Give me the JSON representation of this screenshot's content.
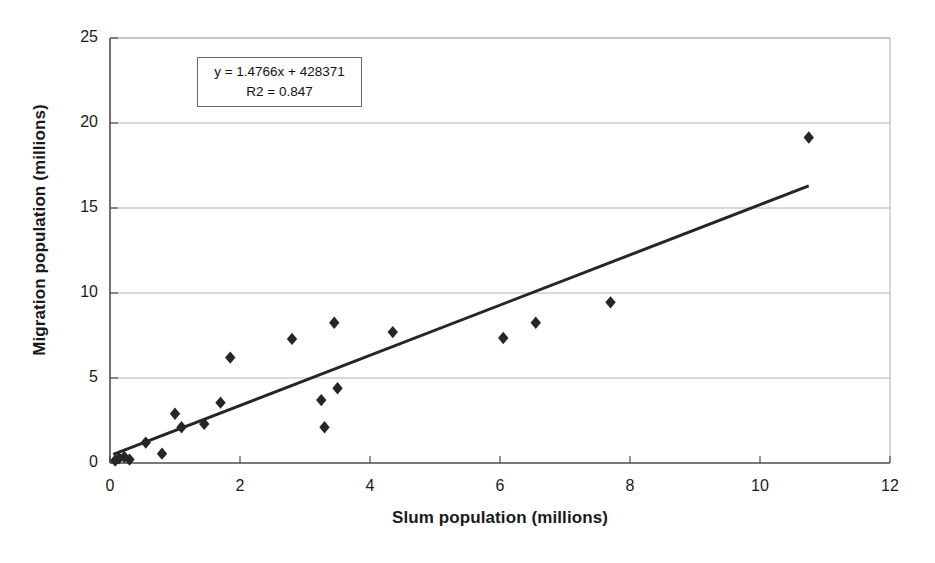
{
  "chart_data": {
    "type": "scatter",
    "title": "",
    "xlabel": "Slum population (millions)",
    "ylabel": "Migration population (millions)",
    "xlim": [
      0,
      12
    ],
    "ylim": [
      0,
      25
    ],
    "xticks": [
      "0",
      "2",
      "4",
      "6",
      "8",
      "10",
      "12"
    ],
    "xtick_values": [
      0,
      2,
      4,
      6,
      8,
      10,
      12
    ],
    "yticks": [
      "0",
      "5",
      "10",
      "15",
      "20",
      "25"
    ],
    "ytick_values": [
      0,
      5,
      10,
      15,
      20,
      25
    ],
    "grid": "horizontal",
    "legend": "none",
    "marker": "diamond",
    "marker_color": "#262626",
    "points": [
      {
        "x": 0.08,
        "y": 0.15
      },
      {
        "x": 0.14,
        "y": 0.28
      },
      {
        "x": 0.22,
        "y": 0.35
      },
      {
        "x": 0.3,
        "y": 0.2
      },
      {
        "x": 0.55,
        "y": 1.2
      },
      {
        "x": 0.8,
        "y": 0.55
      },
      {
        "x": 1.0,
        "y": 2.9
      },
      {
        "x": 1.1,
        "y": 2.1
      },
      {
        "x": 1.45,
        "y": 2.3
      },
      {
        "x": 1.7,
        "y": 3.55
      },
      {
        "x": 1.85,
        "y": 6.2
      },
      {
        "x": 2.8,
        "y": 7.3
      },
      {
        "x": 3.25,
        "y": 3.7
      },
      {
        "x": 3.3,
        "y": 2.1
      },
      {
        "x": 3.45,
        "y": 8.25
      },
      {
        "x": 3.5,
        "y": 4.4
      },
      {
        "x": 4.35,
        "y": 7.7
      },
      {
        "x": 6.05,
        "y": 7.35
      },
      {
        "x": 6.55,
        "y": 8.25
      },
      {
        "x": 7.7,
        "y": 9.45
      },
      {
        "x": 10.75,
        "y": 19.15
      }
    ],
    "trendline": {
      "type": "linear",
      "slope": 1.4766,
      "intercept": 0.428371,
      "x_start": 0.05,
      "x_end": 10.75,
      "color": "#262626"
    },
    "annotation": {
      "equation": "y = 1.4766x + 428371",
      "r_squared": "R2 = 0.847"
    }
  },
  "colors": {
    "axis": "#4d4d4d",
    "grid": "#b3b3b3",
    "marker": "#262626",
    "text": "#1a1a1a"
  }
}
